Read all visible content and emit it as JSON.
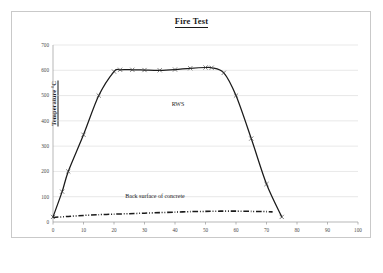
{
  "figure": {
    "title": "Fire Test",
    "frame_color": "#c9c9c9",
    "background": "#ffffff"
  },
  "axes": {
    "y_axis_title": "Temperature °C",
    "y_ticks": [
      "0",
      "100",
      "200",
      "300",
      "400",
      "500",
      "600",
      "700"
    ],
    "x_ticks": [
      "0",
      "10",
      "20",
      "30",
      "40",
      "50",
      "60",
      "70",
      "80",
      "90",
      "100"
    ],
    "gridlines": "horizontal",
    "axis_color": "#9a9a9a",
    "grid_color": "#d0d0d0"
  },
  "annotations": {
    "rws_label": "RWS",
    "concrete_label": "Back surface of concrete"
  },
  "chart_data": {
    "type": "line",
    "title": "Fire Test",
    "xlabel": "",
    "ylabel": "Temperature °C",
    "xlim": [
      0,
      100
    ],
    "ylim": [
      0,
      700
    ],
    "grid": true,
    "legend": "none (inline annotations)",
    "series": [
      {
        "name": "RWS",
        "style": "solid-with-x-markers",
        "color": "#1a1a1a",
        "x": [
          0,
          3,
          5,
          10,
          15,
          20,
          22,
          26,
          30,
          35,
          40,
          45,
          50,
          52,
          56,
          60,
          65,
          70,
          75
        ],
        "values": [
          20,
          120,
          200,
          345,
          500,
          595,
          602,
          602,
          601,
          600,
          603,
          608,
          611,
          610,
          590,
          500,
          330,
          150,
          20
        ]
      },
      {
        "name": "Back surface of concrete",
        "style": "dash-dot-dot",
        "color": "#1a1a1a",
        "x": [
          0,
          5,
          10,
          15,
          20,
          25,
          30,
          35,
          40,
          45,
          50,
          55,
          60,
          65,
          70,
          72
        ],
        "values": [
          18,
          22,
          26,
          29,
          31,
          33,
          35,
          37,
          39,
          41,
          42,
          43,
          43,
          42,
          41,
          40
        ]
      }
    ]
  }
}
